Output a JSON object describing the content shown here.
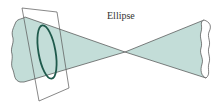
{
  "diagram": {
    "title": "Ellipse",
    "label": "Ellipse",
    "colors": {
      "cone_fill": "#c3ddd8",
      "cone_stroke": "#4a4a4a",
      "ellipse_stroke": "#1f5a4c",
      "plane_stroke": "#555555",
      "background": "#ffffff"
    },
    "elements": [
      {
        "name": "left-cone",
        "type": "cone-nappe"
      },
      {
        "name": "right-cone",
        "type": "cone-nappe"
      },
      {
        "name": "cutting-plane",
        "type": "plane"
      },
      {
        "name": "ellipse-curve",
        "type": "conic-section"
      }
    ]
  }
}
